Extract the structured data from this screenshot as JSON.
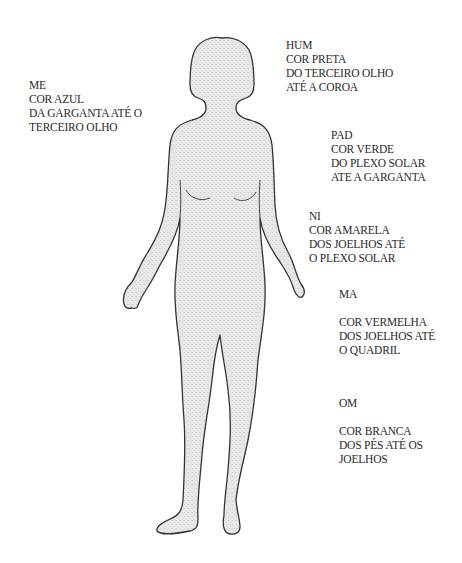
{
  "figure": {
    "fill_color": "#e6e6e6",
    "outline_color": "#333333"
  },
  "labels": [
    {
      "id": "me",
      "title": "ME",
      "color": "COR AZUL",
      "line3": "DA GARGANTA ATÉ O",
      "line4": "TERCEIRO OLHO"
    },
    {
      "id": "hum",
      "title": "HUM",
      "color": "COR PRETA",
      "line3": "DO TERCEIRO OLHO",
      "line4": "ATÉ A COROA"
    },
    {
      "id": "pad",
      "title": "PAD",
      "color": "COR VERDE",
      "line3": "DO PLEXO SOLAR",
      "line4": "ATE A GARGANTA"
    },
    {
      "id": "ni",
      "title": "NI",
      "color": "COR AMARELA",
      "line3": "DOS JOELHOS ATÉ",
      "line4": "O PLEXO SOLAR"
    },
    {
      "id": "ma",
      "title": "MA",
      "color": "COR VERMELHA",
      "line3": "DOS JOELHOS ATÉ",
      "line4": "O QUADRIL"
    },
    {
      "id": "om",
      "title": "OM",
      "color": "COR BRANCA",
      "line3": "DOS PÉS ATÉ OS",
      "line4": "JOELHOS"
    }
  ]
}
